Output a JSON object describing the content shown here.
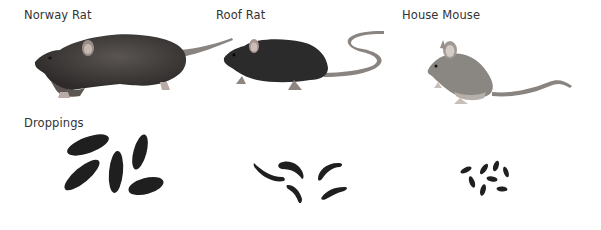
{
  "labels": {
    "norway_rat": "Norway Rat",
    "roof_rat": "Roof Rat",
    "house_mouse": "House Mouse",
    "droppings": "Droppings"
  },
  "colors": {
    "text": "#333333",
    "dropping": "#1a1a1a",
    "norway_body": "#3d3a38",
    "roof_body": "#2b2b2b",
    "mouse_body": "#8a8682",
    "tail": "#8a8480"
  }
}
